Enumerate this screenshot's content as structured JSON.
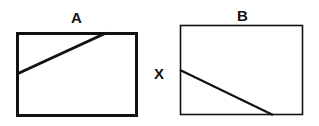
{
  "figure": {
    "panels": [
      {
        "id": "A",
        "label": "A"
      },
      {
        "id": "B",
        "label": "B"
      }
    ],
    "side_label": "X",
    "colors": {
      "stroke": "#111111",
      "background": "#ffffff"
    }
  }
}
